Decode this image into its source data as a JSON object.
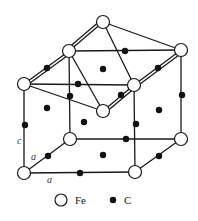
{
  "diagram": {
    "type": "crystal-structure",
    "atoms": {
      "fe": [
        {
          "id": "A",
          "x": 69,
          "y": 51
        },
        {
          "id": "B",
          "x": 103,
          "y": 22
        },
        {
          "id": "C",
          "x": 181,
          "y": 50
        },
        {
          "id": "D",
          "x": 24,
          "y": 84
        },
        {
          "id": "E",
          "x": 134,
          "y": 85
        },
        {
          "id": "F",
          "x": 103,
          "y": 111
        },
        {
          "id": "G",
          "x": 70,
          "y": 139
        },
        {
          "id": "H",
          "x": 181,
          "y": 139
        },
        {
          "id": "I",
          "x": 24,
          "y": 173
        },
        {
          "id": "J",
          "x": 135,
          "y": 172
        }
      ],
      "c": [
        {
          "x": 47,
          "y": 68
        },
        {
          "x": 125,
          "y": 51
        },
        {
          "x": 103,
          "y": 69
        },
        {
          "x": 158,
          "y": 68
        },
        {
          "x": 78,
          "y": 84
        },
        {
          "x": 70,
          "y": 96
        },
        {
          "x": 121,
          "y": 95
        },
        {
          "x": 47,
          "y": 108
        },
        {
          "x": 182,
          "y": 95
        },
        {
          "x": 25,
          "y": 125
        },
        {
          "x": 84,
          "y": 122
        },
        {
          "x": 159,
          "y": 110
        },
        {
          "x": 136,
          "y": 124
        },
        {
          "x": 126,
          "y": 139
        },
        {
          "x": 48,
          "y": 156
        },
        {
          "x": 103,
          "y": 155
        },
        {
          "x": 80,
          "y": 173
        },
        {
          "x": 159,
          "y": 156
        }
      ]
    },
    "axis_labels": [
      {
        "text": "c",
        "x": 17,
        "y": 144
      },
      {
        "text": "a",
        "x": 31,
        "y": 160
      },
      {
        "text": "a",
        "x": 47,
        "y": 183
      }
    ],
    "legend": [
      {
        "symbol": "open-circle",
        "label": "Fe"
      },
      {
        "symbol": "filled-dot",
        "label": "C"
      }
    ]
  }
}
